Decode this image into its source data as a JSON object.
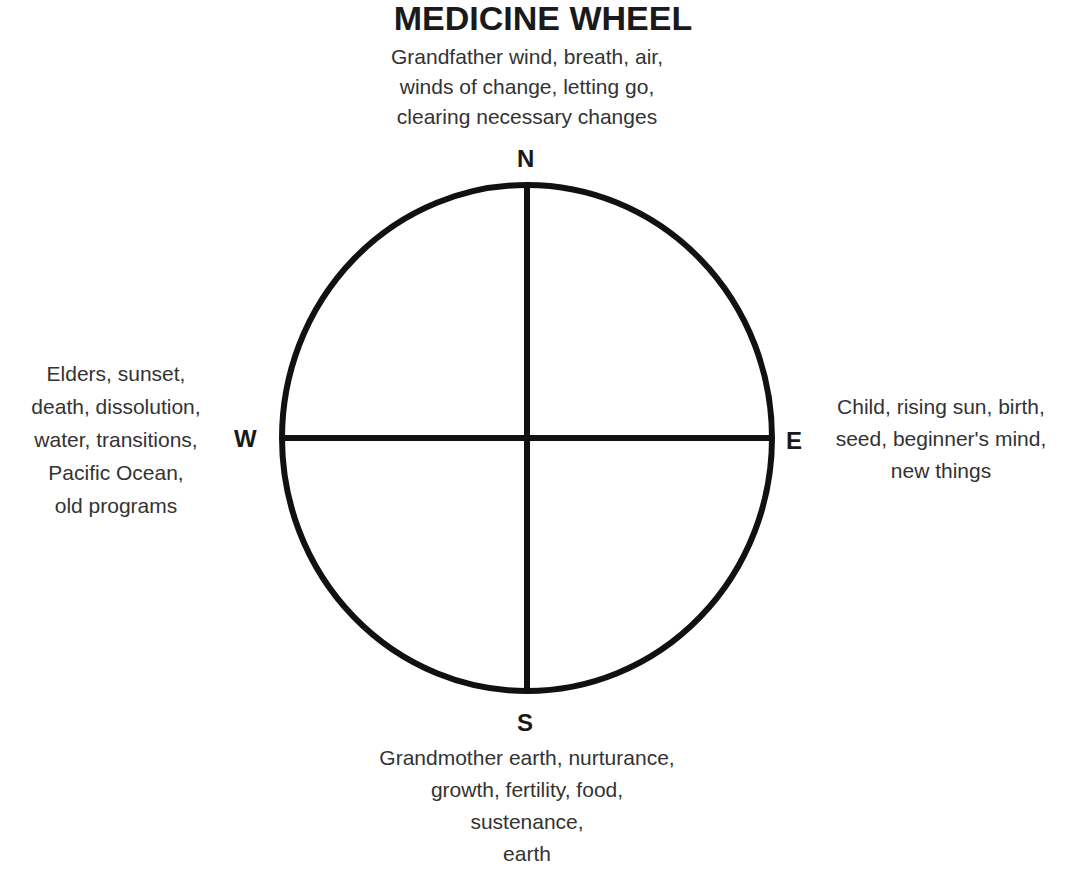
{
  "title": "MEDICINE WHEEL",
  "wheel": {
    "center": [
      527,
      438
    ],
    "rx": 245,
    "ry": 253,
    "stroke_color": "#111111",
    "stroke_width": 6
  },
  "directions": {
    "north": {
      "label": "N",
      "lines": [
        "Grandfather wind, breath, air,",
        "winds of change, letting go,",
        "clearing necessary changes"
      ]
    },
    "west": {
      "label": "W",
      "lines": [
        "Elders, sunset,",
        "death, dissolution,",
        "water, transitions,",
        "Pacific Ocean,",
        "old programs"
      ]
    },
    "east": {
      "label": "E",
      "lines": [
        "Child, rising sun, birth,",
        "seed, beginner's mind,",
        "new things"
      ]
    },
    "south": {
      "label": "S",
      "lines": [
        "Grandmother earth, nurturance,",
        "growth, fertility, food,",
        "sustenance,",
        "earth"
      ]
    }
  }
}
